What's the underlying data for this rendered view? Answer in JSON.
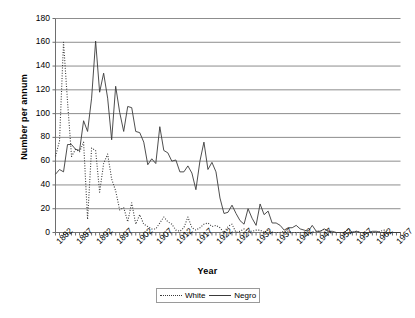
{
  "chart_data": {
    "type": "line",
    "title": "",
    "xlabel": "Year",
    "ylabel": "Number per annum",
    "ylim": [
      0,
      180
    ],
    "ytick_step": 20,
    "yticks": [
      0,
      20,
      40,
      60,
      80,
      100,
      120,
      140,
      160,
      180
    ],
    "xlim": [
      1882,
      1968
    ],
    "xticks": [
      1882,
      1887,
      1892,
      1897,
      1902,
      1907,
      1912,
      1917,
      1922,
      1927,
      1932,
      1937,
      1942,
      1947,
      1952,
      1957,
      1962,
      1967
    ],
    "xtick_labels": [
      "1882",
      "1887",
      "1892",
      "1897",
      "1902",
      "1907",
      "1912",
      "1917",
      "1922",
      "1927",
      "1932",
      "1937",
      "1942",
      "1947",
      "1952",
      "1957",
      "1962",
      "1967"
    ],
    "xtick_rotation": -45,
    "grid": "horizontal",
    "legend_position": "bottom",
    "x": [
      1882,
      1883,
      1884,
      1885,
      1886,
      1887,
      1888,
      1889,
      1890,
      1891,
      1892,
      1893,
      1894,
      1895,
      1896,
      1897,
      1898,
      1899,
      1900,
      1901,
      1902,
      1903,
      1904,
      1905,
      1906,
      1907,
      1908,
      1909,
      1910,
      1911,
      1912,
      1913,
      1914,
      1915,
      1916,
      1917,
      1918,
      1919,
      1920,
      1921,
      1922,
      1923,
      1924,
      1925,
      1926,
      1927,
      1928,
      1929,
      1930,
      1931,
      1932,
      1933,
      1934,
      1935,
      1936,
      1937,
      1938,
      1939,
      1940,
      1941,
      1942,
      1943,
      1944,
      1945,
      1946,
      1947,
      1948,
      1949,
      1950,
      1951,
      1952,
      1953,
      1954,
      1955,
      1956,
      1957,
      1958,
      1959,
      1960,
      1961,
      1962,
      1963,
      1964,
      1965,
      1966,
      1967,
      1968
    ],
    "series": [
      {
        "name": "White",
        "style": "dotted",
        "color": "#3a3a3a",
        "values": [
          64,
          77,
          160,
          110,
          64,
          70,
          68,
          76,
          11,
          71,
          69,
          34,
          58,
          66,
          45,
          35,
          19,
          21,
          9,
          25,
          7,
          15,
          7,
          5,
          3,
          3,
          8,
          13,
          9,
          7,
          2,
          1,
          4,
          13,
          4,
          2,
          4,
          7,
          8,
          5,
          6,
          4,
          0,
          5,
          7,
          0,
          1,
          3,
          1,
          1,
          2,
          2,
          0,
          2,
          0,
          0,
          0,
          1,
          1,
          0,
          0,
          0,
          0,
          0,
          0,
          1,
          1,
          3,
          1,
          0,
          0,
          0,
          0,
          0,
          0,
          1,
          0,
          0,
          0,
          0,
          0,
          1,
          2,
          0,
          0,
          0,
          0
        ]
      },
      {
        "name": "Negro",
        "style": "solid",
        "color": "#3a3a3a",
        "values": [
          49,
          53,
          51,
          74,
          74,
          70,
          69,
          94,
          85,
          113,
          161,
          118,
          134,
          113,
          78,
          123,
          101,
          85,
          106,
          105,
          85,
          84,
          76,
          57,
          62,
          58,
          89,
          69,
          67,
          60,
          61,
          51,
          51,
          56,
          50,
          36,
          60,
          76,
          53,
          59,
          51,
          29,
          16,
          17,
          23,
          16,
          10,
          7,
          20,
          12,
          6,
          24,
          15,
          18,
          8,
          8,
          6,
          2,
          4,
          4,
          6,
          3,
          2,
          1,
          6,
          1,
          1,
          3,
          1,
          1,
          0,
          0,
          0,
          3,
          0,
          1,
          0,
          0,
          0,
          1,
          1,
          0,
          0,
          0,
          0,
          0,
          0
        ]
      }
    ]
  },
  "axes": {
    "y_title": "Number per annum",
    "x_title": "Year"
  },
  "legend": {
    "entries": [
      {
        "label": "White",
        "style": "dotted"
      },
      {
        "label": "Negro",
        "style": "solid"
      }
    ]
  }
}
